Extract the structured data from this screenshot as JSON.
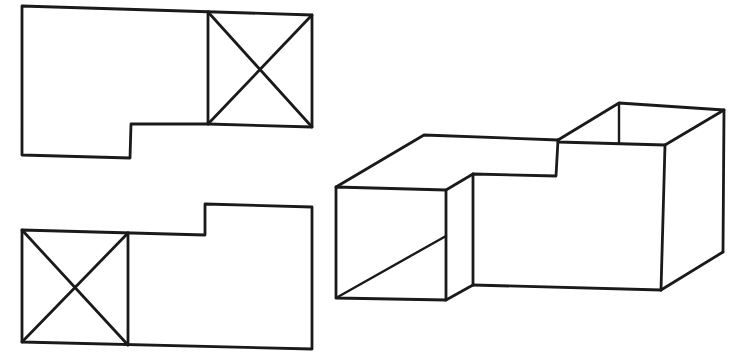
{
  "figure": {
    "background": "#ffffff",
    "stroke_color": "#1a1a1a",
    "views": [
      {
        "name": "top-view",
        "outline": [
          [
            22,
            6
          ],
          [
            312,
            15
          ],
          [
            312,
            127
          ],
          [
            208,
            124
          ],
          [
            131,
            124
          ],
          [
            130,
            158
          ],
          [
            22,
            155
          ],
          [
            22,
            6
          ]
        ],
        "crossed_box": {
          "corners": [
            [
              208,
              12
            ],
            [
              312,
              15
            ],
            [
              312,
              127
            ],
            [
              208,
              124
            ]
          ],
          "meaning": "opening / hole marked with X"
        }
      },
      {
        "name": "bottom-view",
        "outline": [
          [
            22,
            230
          ],
          [
            205,
            235
          ],
          [
            205,
            204
          ],
          [
            312,
            207
          ],
          [
            312,
            349
          ],
          [
            22,
            342
          ],
          [
            22,
            230
          ]
        ],
        "crossed_box": {
          "corners": [
            [
              22,
              230
            ],
            [
              128,
              233
            ],
            [
              128,
              345
            ],
            [
              22,
              342
            ]
          ],
          "meaning": "opening / hole marked with X"
        }
      },
      {
        "name": "isometric-view",
        "type": "3d-pictorial"
      }
    ]
  }
}
